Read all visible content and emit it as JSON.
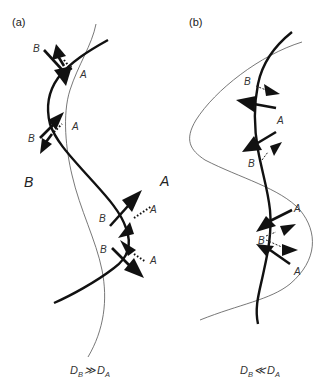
{
  "figure": {
    "panels": [
      {
        "id": "a",
        "label": "(a)",
        "region_labels": {
          "left": "B",
          "right": "A"
        },
        "point_labels": [
          {
            "text": "B",
            "role": "upper-pair-B"
          },
          {
            "text": "A",
            "role": "upper-pair-A"
          },
          {
            "text": "B",
            "role": "mid-pair-B"
          },
          {
            "text": "A",
            "role": "mid-pair-A"
          },
          {
            "text": "B",
            "role": "lower-pair-1-B"
          },
          {
            "text": "A",
            "role": "lower-pair-1-A"
          },
          {
            "text": "B",
            "role": "lower-pair-2-B"
          },
          {
            "text": "A",
            "role": "lower-pair-2-A"
          }
        ],
        "caption": {
          "main": "D",
          "sub_left": "B",
          "relation": "≫",
          "main2": "D",
          "sub_right": "A",
          "text": "D_B ≫ D_A"
        }
      },
      {
        "id": "b",
        "label": "(b)",
        "region_labels": {
          "inner": "A"
        },
        "point_labels": [
          {
            "text": "B",
            "role": "upper-B"
          },
          {
            "text": "B",
            "role": "mid-B"
          },
          {
            "text": "A",
            "role": "lower-A-upper"
          },
          {
            "text": "B",
            "role": "lower-B"
          },
          {
            "text": "A",
            "role": "lower-A-lower"
          }
        ],
        "caption": {
          "main": "D",
          "sub_left": "B",
          "relation": "≪",
          "main2": "D",
          "sub_right": "A",
          "text": "D_B ≪ D_A"
        }
      }
    ],
    "colors": {
      "ink": "#111111",
      "thin_line": "#555555",
      "background": "#ffffff"
    }
  }
}
